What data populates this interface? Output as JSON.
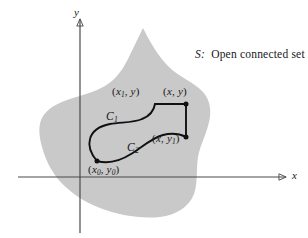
{
  "figure": {
    "name": "open-connected-set-diagram",
    "caption": {
      "set_symbol": "S:",
      "text": "Open connected set"
    },
    "axes": {
      "x_label": "x",
      "y_label": "y",
      "x_axis_y_position": 177,
      "y_axis_x_position": 80
    },
    "region": {
      "name": "S",
      "fill_color": "#c9c9c9",
      "description": "shaded open connected region"
    },
    "points": [
      {
        "id": "p-x1-y",
        "text": "(x₁, y)",
        "var1": "x",
        "sub1": "1",
        "var2": "y",
        "sub2": ""
      },
      {
        "id": "p-x-y",
        "text": "(x, y)",
        "var1": "x",
        "sub1": "",
        "var2": "y",
        "sub2": ""
      },
      {
        "id": "p-x-y1",
        "text": "(x, y₁)",
        "var1": "x",
        "sub1": "",
        "var2": "y",
        "sub2": "1"
      },
      {
        "id": "p-x0-y0",
        "text": "(x₀, y₀)",
        "var1": "x",
        "sub1": "0",
        "var2": "y",
        "sub2": "0"
      }
    ],
    "curves": [
      {
        "id": "curve-c1",
        "label": "C",
        "subscript": "1"
      },
      {
        "id": "curve-c2",
        "label": "C",
        "subscript": "2"
      }
    ],
    "colors": {
      "region_fill": "#c9c9c9",
      "axis": "#4a4a4f",
      "curve": "#111114",
      "text": "#17171a",
      "background": "#ffffff"
    }
  }
}
